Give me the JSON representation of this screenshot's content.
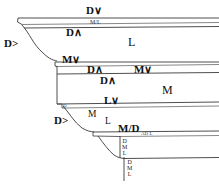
{
  "diagram": {
    "type": "stratigraphic-cross-section",
    "background_color": "#ffffff",
    "line_color": "#3a3a3a",
    "text_color": "#111111",
    "labels": [
      {
        "id": "top-d-down",
        "text": "D∨",
        "x": 86,
        "y": 5,
        "size": "big"
      },
      {
        "id": "top-ml",
        "text": "M/L",
        "x": 90,
        "y": 21,
        "size": "sm"
      },
      {
        "id": "top-d-up",
        "text": "D∧",
        "x": 66,
        "y": 29,
        "size": "big"
      },
      {
        "id": "left-d-gt-1",
        "text": "D>",
        "x": 5,
        "y": 39,
        "size": "big"
      },
      {
        "id": "zone-l",
        "text": "L",
        "x": 128,
        "y": 38,
        "size": "huge"
      },
      {
        "id": "mid-m-down",
        "text": "M∨",
        "x": 63,
        "y": 56,
        "size": "big"
      },
      {
        "id": "mid-d-up-1",
        "text": "D∧",
        "x": 88,
        "y": 67,
        "size": "big"
      },
      {
        "id": "mid-m-down-2",
        "text": "M∨",
        "x": 134,
        "y": 67,
        "size": "big"
      },
      {
        "id": "mid-d-up-2",
        "text": "D∧",
        "x": 101,
        "y": 77,
        "size": "big"
      },
      {
        "id": "zone-m",
        "text": "M",
        "x": 163,
        "y": 86,
        "size": "huge"
      },
      {
        "id": "mid-l-down",
        "text": "L∨",
        "x": 104,
        "y": 98,
        "size": "big"
      },
      {
        "id": "small-d",
        "text": "D",
        "x": 63,
        "y": 105,
        "size": "xs"
      },
      {
        "id": "left-d-gt-2",
        "text": "D>",
        "x": 55,
        "y": 117,
        "size": "big"
      },
      {
        "id": "low-m",
        "text": "M",
        "x": 88,
        "y": 112,
        "size": "mid"
      },
      {
        "id": "low-l",
        "text": "L",
        "x": 105,
        "y": 118,
        "size": "mid"
      },
      {
        "id": "low-md",
        "text": "M/D",
        "x": 119,
        "y": 125,
        "size": "big"
      },
      {
        "id": "low-adl",
        "text": "AD L",
        "x": 141,
        "y": 133,
        "size": "xs"
      }
    ],
    "stacks": [
      {
        "id": "stack-upper",
        "items": [
          "D",
          "M",
          "L"
        ],
        "x": 123,
        "y": 139
      },
      {
        "id": "stack-lower",
        "items": [
          "D",
          "M",
          "L"
        ],
        "x": 128,
        "y": 160
      }
    ]
  }
}
